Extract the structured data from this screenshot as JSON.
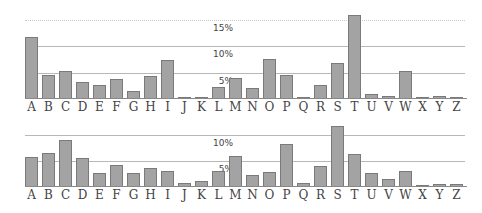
{
  "chart_data": [
    {
      "type": "bar",
      "title": "",
      "xlabel": "",
      "ylabel": "",
      "categories": [
        "A",
        "B",
        "C",
        "D",
        "E",
        "F",
        "G",
        "H",
        "I",
        "J",
        "K",
        "L",
        "M",
        "N",
        "O",
        "P",
        "Q",
        "R",
        "S",
        "T",
        "U",
        "V",
        "W",
        "X",
        "Y",
        "Z"
      ],
      "values": [
        11.7,
        4.6,
        5.3,
        3.2,
        2.6,
        3.8,
        1.6,
        4.3,
        7.3,
        0.4,
        0.2,
        2.3,
        3.9,
        2.1,
        7.5,
        4.5,
        0.2,
        2.7,
        6.7,
        15.8,
        1.0,
        0.6,
        5.2,
        0.2,
        0.5,
        0.2
      ],
      "yticks": [
        "5%",
        "10%",
        "15%"
      ],
      "ylim": [
        0,
        16
      ],
      "grid": true,
      "legend": null
    },
    {
      "type": "bar",
      "title": "",
      "xlabel": "",
      "ylabel": "",
      "categories": [
        "A",
        "B",
        "C",
        "D",
        "E",
        "F",
        "G",
        "H",
        "I",
        "J",
        "K",
        "L",
        "M",
        "N",
        "O",
        "P",
        "Q",
        "R",
        "S",
        "T",
        "U",
        "V",
        "W",
        "X",
        "Y",
        "Z"
      ],
      "values": [
        5.8,
        6.5,
        9.0,
        5.6,
        2.7,
        4.2,
        2.6,
        3.7,
        3.0,
        0.8,
        1.1,
        3.0,
        6.0,
        2.3,
        2.8,
        8.2,
        0.8,
        4.0,
        11.7,
        6.3,
        2.7,
        1.5,
        3.0,
        0.1,
        0.5,
        0.5
      ],
      "yticks": [
        "5%",
        "10%"
      ],
      "ylim": [
        0,
        12
      ],
      "grid": true,
      "legend": null
    }
  ]
}
